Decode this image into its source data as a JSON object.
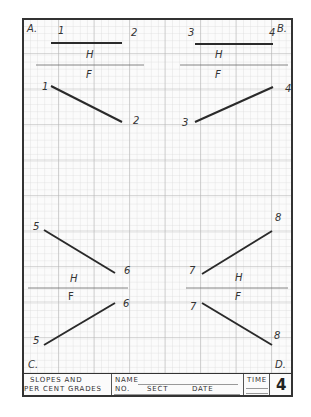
{
  "sheet": {
    "corners": {
      "a": "A.",
      "b": "B.",
      "c": "C.",
      "d": "D."
    },
    "view_labels": {
      "horizontal": "H",
      "frontal": "F"
    },
    "problem_a": {
      "top_left": "1",
      "top_right": "2",
      "front_left": "1",
      "front_right": "2"
    },
    "problem_b": {
      "top_left": "3",
      "top_right": "4",
      "front_left": "3",
      "front_right": "4"
    },
    "problem_c": {
      "top_left": "5",
      "top_right": "6",
      "front_left": "5",
      "front_right": "6"
    },
    "problem_d": {
      "top_left": "7",
      "top_right": "8",
      "front_left": "7",
      "front_right": "8"
    }
  },
  "title_block": {
    "title_line1": "SLOPES AND",
    "title_line2": "PER CENT GRADES",
    "name_label": "NAME",
    "no_label": "NO.",
    "sect_label": "SECT",
    "date_label": "DATE",
    "time_label": "TIME",
    "sheet_number": "4"
  },
  "colors": {
    "grid_minor": "#d6d6d6",
    "grid_major": "#b8b8b8",
    "ink": "#2a2a2a",
    "frame": "#333333"
  }
}
